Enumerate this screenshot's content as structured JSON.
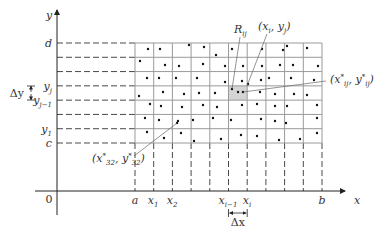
{
  "figure": {
    "axes": {
      "x_label": "x",
      "y_label": "y",
      "origin_label": "0",
      "origin": [
        57,
        191
      ],
      "x_end": 345,
      "y_top": 10,
      "y_bottom": 215
    },
    "grid": {
      "left": 135,
      "right": 322,
      "top": 43,
      "bottom": 143,
      "cols": 10,
      "rows": 7,
      "line_color": "#9a9a9a",
      "shaded_cell": {
        "col": 5,
        "row": 3,
        "color": "#d4d4d4"
      }
    },
    "y_labels": [
      {
        "text": "d",
        "sub": "",
        "y": 43
      },
      {
        "text": "y",
        "sub": "j",
        "y": 86
      },
      {
        "text": "y",
        "sub": "j−1",
        "y": 100
      },
      {
        "text": "y",
        "sub": "1",
        "y": 129
      },
      {
        "text": "c",
        "sub": "",
        "y": 143
      }
    ],
    "x_labels": [
      {
        "text": "a",
        "sub": "",
        "x": 135
      },
      {
        "text": "x",
        "sub": "1",
        "x": 153
      },
      {
        "text": "x",
        "sub": "2",
        "x": 172
      },
      {
        "text": "x",
        "sub": "i−1",
        "x": 228
      },
      {
        "text": "x",
        "sub": "i",
        "x": 247
      },
      {
        "text": "b",
        "sub": "",
        "x": 322
      }
    ],
    "delta_x_label": "Δx",
    "delta_y_label": "Δy",
    "region_label": {
      "text": "R",
      "sub": "ij"
    },
    "callouts": [
      {
        "label": "(xi, yj)",
        "text": "(x",
        "sub1": "i",
        "mid": ", y",
        "sub2": "j",
        "end": ")",
        "lx": 258,
        "ly": 30,
        "from": [
          267,
          34
        ],
        "to": [
          247,
          86
        ]
      },
      {
        "label": "(x*ij, y*ij)",
        "text": "(x",
        "sub1": "ij",
        "sup1": "*",
        "mid": ", y",
        "sub2": "ij",
        "sup2": "*",
        "end": ")",
        "lx": 330,
        "ly": 83,
        "from": [
          326,
          81
        ],
        "to": [
          243,
          92
        ]
      },
      {
        "label": "(x*32, y*32)",
        "text": "(x",
        "sub1": "32",
        "sup1": "*",
        "mid": ", y",
        "sub2": "32",
        "sup2": "*",
        "end": ")",
        "lx": 92,
        "ly": 162,
        "from": [
          134,
          156
        ],
        "to": [
          177,
          123
        ]
      }
    ],
    "sample_points": [
      [
        148,
        49
      ],
      [
        160,
        49
      ],
      [
        189,
        45
      ],
      [
        204,
        47
      ],
      [
        216,
        55
      ],
      [
        232,
        49
      ],
      [
        262,
        49
      ],
      [
        283,
        50
      ],
      [
        287,
        46
      ],
      [
        307,
        48
      ],
      [
        140,
        61
      ],
      [
        165,
        65
      ],
      [
        179,
        66
      ],
      [
        203,
        64
      ],
      [
        225,
        66
      ],
      [
        243,
        66
      ],
      [
        262,
        66
      ],
      [
        280,
        65
      ],
      [
        293,
        65
      ],
      [
        318,
        66
      ],
      [
        147,
        78
      ],
      [
        159,
        78
      ],
      [
        176,
        78
      ],
      [
        197,
        78
      ],
      [
        225,
        82
      ],
      [
        242,
        81
      ],
      [
        248,
        84
      ],
      [
        261,
        80
      ],
      [
        269,
        78
      ],
      [
        291,
        78
      ],
      [
        314,
        80
      ],
      [
        139,
        96
      ],
      [
        163,
        92
      ],
      [
        184,
        94
      ],
      [
        199,
        93
      ],
      [
        215,
        93
      ],
      [
        232,
        89
      ],
      [
        238,
        92
      ],
      [
        243,
        92
      ],
      [
        260,
        92
      ],
      [
        275,
        94
      ],
      [
        294,
        94
      ],
      [
        307,
        95
      ],
      [
        150,
        104
      ],
      [
        161,
        106
      ],
      [
        182,
        107
      ],
      [
        203,
        105
      ],
      [
        217,
        107
      ],
      [
        242,
        105
      ],
      [
        257,
        104
      ],
      [
        275,
        106
      ],
      [
        287,
        106
      ],
      [
        317,
        105
      ],
      [
        145,
        118
      ],
      [
        159,
        120
      ],
      [
        177,
        123
      ],
      [
        178,
        121
      ],
      [
        193,
        120
      ],
      [
        213,
        118
      ],
      [
        231,
        120
      ],
      [
        261,
        119
      ],
      [
        275,
        121
      ],
      [
        286,
        123
      ],
      [
        317,
        118
      ],
      [
        147,
        132
      ],
      [
        164,
        138
      ],
      [
        181,
        133
      ],
      [
        194,
        141
      ],
      [
        221,
        139
      ],
      [
        241,
        135
      ],
      [
        257,
        136
      ],
      [
        279,
        140
      ],
      [
        300,
        139
      ],
      [
        317,
        133
      ]
    ]
  }
}
